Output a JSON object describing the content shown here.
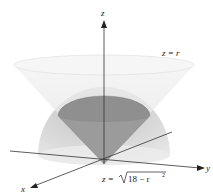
{
  "figure": {
    "axes": {
      "x": "x",
      "y": "y",
      "z": "z"
    },
    "surfaces": [
      {
        "name": "cone",
        "equation": "z = r"
      },
      {
        "name": "hemisphere",
        "equation_prefix": "z = ",
        "radicand": "18 − r",
        "exponent": "2"
      }
    ],
    "colors": {
      "cone_outer": "#e9e9e9",
      "cone_inner": "#8a8a8a",
      "sphere": "#c9c9c9",
      "axis": "#333333"
    }
  }
}
